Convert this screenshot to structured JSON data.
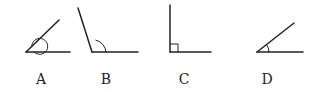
{
  "figure": {
    "angles": [
      {
        "label": "A",
        "type": "reflex",
        "marker": "full arc around vertex"
      },
      {
        "label": "B",
        "type": "obtuse",
        "marker": "arc"
      },
      {
        "label": "C",
        "type": "right",
        "marker": "square"
      },
      {
        "label": "D",
        "type": "acute",
        "marker": "arc"
      }
    ]
  },
  "colors": {
    "stroke": "#222222",
    "background": "#ffffff"
  }
}
